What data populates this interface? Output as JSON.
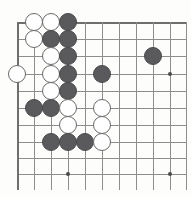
{
  "diagram": {
    "board": {
      "origin_x": 17,
      "origin_y": 22,
      "spacing": 17,
      "cols": 10,
      "rows": 10,
      "line_color": "#8d8d8d",
      "edge_color": "#6f6f6f",
      "background_color": "#fdfdfb"
    },
    "colors": {
      "black_stone": "#5a5a5c",
      "white_stone": "#ffffff",
      "white_stone_outline": "#6a6a6a",
      "star_point": "#4a4a4a"
    },
    "star_points": [
      {
        "name": "star-point-left-middle",
        "x": 170,
        "y": 74
      },
      {
        "name": "star-point-bottom-left",
        "x": 68,
        "y": 174
      },
      {
        "name": "star-point-bottom-right",
        "x": 170,
        "y": 174
      }
    ],
    "stones": [
      {
        "id": "w-a1",
        "color": "white",
        "x": 34,
        "y": 22
      },
      {
        "id": "w-b1",
        "color": "white",
        "x": 51,
        "y": 22
      },
      {
        "id": "b-c1",
        "color": "black",
        "x": 68,
        "y": 22
      },
      {
        "id": "w-a2",
        "color": "white",
        "x": 34,
        "y": 39
      },
      {
        "id": "b-b2",
        "color": "black",
        "x": 51,
        "y": 39
      },
      {
        "id": "b-c2",
        "color": "black",
        "x": 68,
        "y": 39
      },
      {
        "id": "w-b3",
        "color": "white",
        "x": 51,
        "y": 56
      },
      {
        "id": "b-c3",
        "color": "black",
        "x": 68,
        "y": 56
      },
      {
        "id": "w-edge4",
        "color": "white",
        "x": 17,
        "y": 74
      },
      {
        "id": "w-b4",
        "color": "white",
        "x": 51,
        "y": 74
      },
      {
        "id": "b-c4",
        "color": "black",
        "x": 68,
        "y": 74
      },
      {
        "id": "b-e4",
        "color": "black",
        "x": 102,
        "y": 74
      },
      {
        "id": "b-h3",
        "color": "black",
        "x": 153,
        "y": 56
      },
      {
        "id": "w-b5",
        "color": "white",
        "x": 51,
        "y": 91
      },
      {
        "id": "b-c5",
        "color": "black",
        "x": 68,
        "y": 91
      },
      {
        "id": "b-a6",
        "color": "black",
        "x": 34,
        "y": 108
      },
      {
        "id": "b-b6",
        "color": "black",
        "x": 51,
        "y": 108
      },
      {
        "id": "w-c6",
        "color": "white",
        "x": 68,
        "y": 108
      },
      {
        "id": "w-e6",
        "color": "white",
        "x": 102,
        "y": 108
      },
      {
        "id": "w-c7",
        "color": "white",
        "x": 68,
        "y": 125
      },
      {
        "id": "w-e7",
        "color": "white",
        "x": 102,
        "y": 125
      },
      {
        "id": "b-b8",
        "color": "black",
        "x": 51,
        "y": 142
      },
      {
        "id": "b-c8",
        "color": "black",
        "x": 68,
        "y": 142
      },
      {
        "id": "b-d8",
        "color": "black",
        "x": 85,
        "y": 142
      },
      {
        "id": "w-e8",
        "color": "white",
        "x": 102,
        "y": 142
      }
    ],
    "horizontal_lines": [
      {
        "y": 22,
        "x1": 17,
        "x2": 186,
        "edge": true
      },
      {
        "y": 39,
        "x1": 17,
        "x2": 186,
        "edge": false
      },
      {
        "y": 56,
        "x1": 17,
        "x2": 186,
        "edge": false
      },
      {
        "y": 74,
        "x1": 17,
        "x2": 186,
        "edge": false
      },
      {
        "y": 91,
        "x1": 17,
        "x2": 186,
        "edge": false
      },
      {
        "y": 108,
        "x1": 17,
        "x2": 186,
        "edge": false
      },
      {
        "y": 125,
        "x1": 17,
        "x2": 186,
        "edge": false
      },
      {
        "y": 142,
        "x1": 17,
        "x2": 186,
        "edge": false
      },
      {
        "y": 158,
        "x1": 17,
        "x2": 186,
        "edge": false
      },
      {
        "y": 174,
        "x1": 17,
        "x2": 186,
        "edge": false
      }
    ],
    "vertical_lines": [
      {
        "x": 17,
        "y1": 22,
        "y2": 190,
        "edge": true
      },
      {
        "x": 34,
        "y1": 22,
        "y2": 190,
        "edge": false
      },
      {
        "x": 51,
        "y1": 22,
        "y2": 190,
        "edge": false
      },
      {
        "x": 68,
        "y1": 22,
        "y2": 190,
        "edge": false
      },
      {
        "x": 85,
        "y1": 22,
        "y2": 190,
        "edge": false
      },
      {
        "x": 102,
        "y1": 22,
        "y2": 190,
        "edge": false
      },
      {
        "x": 119,
        "y1": 22,
        "y2": 190,
        "edge": false
      },
      {
        "x": 136,
        "y1": 22,
        "y2": 190,
        "edge": false
      },
      {
        "x": 153,
        "y1": 22,
        "y2": 190,
        "edge": false
      },
      {
        "x": 170,
        "y1": 22,
        "y2": 190,
        "edge": false
      },
      {
        "x": 186,
        "y1": 22,
        "y2": 190,
        "edge": false
      }
    ]
  }
}
